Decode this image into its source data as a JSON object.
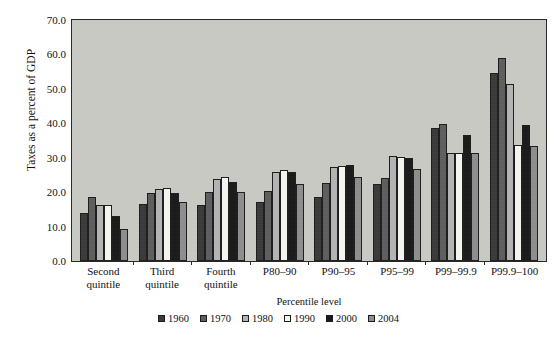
{
  "chart_data": {
    "type": "bar",
    "title": "",
    "xlabel": "Percentile level",
    "ylabel": "Taxes as a percent of GDP",
    "ylim": [
      0.0,
      70.0
    ],
    "yticks": [
      "0.0",
      "10.0",
      "20.0",
      "30.0",
      "40.0",
      "50.0",
      "60.0",
      "70.0"
    ],
    "ytick_values": [
      0,
      10,
      20,
      30,
      40,
      50,
      60,
      70
    ],
    "grid": false,
    "legend_position": "bottom",
    "categories": [
      "Second quintile",
      "Third quintile",
      "Fourth quintile",
      "P80–90",
      "P90–95",
      "P95–99",
      "P99–99.9",
      "P99.9–100"
    ],
    "category_lines": [
      [
        "Second",
        "quintile"
      ],
      [
        "Third",
        "quintile"
      ],
      [
        "Fourth",
        "quintile"
      ],
      [
        "P80–90",
        ""
      ],
      [
        "P90–95",
        ""
      ],
      [
        "P95–99",
        ""
      ],
      [
        "P99–99.9",
        ""
      ],
      [
        "P99.9–100",
        ""
      ]
    ],
    "series": [
      {
        "name": "1960",
        "color": "#3a3a3a",
        "values": [
          13.9,
          16.6,
          16.4,
          17.1,
          18.6,
          22.5,
          38.5,
          54.6
        ]
      },
      {
        "name": "1970",
        "color": "#5e5e5e",
        "values": [
          18.5,
          19.9,
          20.1,
          20.3,
          22.6,
          24.1,
          39.9,
          59.0
        ]
      },
      {
        "name": "1980",
        "color": "#b4b4b4",
        "values": [
          16.2,
          21.0,
          23.9,
          25.9,
          27.2,
          30.6,
          31.4,
          51.3
        ]
      },
      {
        "name": "1990",
        "color": "#f5f5f0",
        "values": [
          16.3,
          21.2,
          24.3,
          26.4,
          27.6,
          30.1,
          31.5,
          33.7
        ]
      },
      {
        "name": "2000",
        "color": "#1a1a1a",
        "values": [
          13.1,
          19.9,
          23.0,
          25.9,
          28.0,
          29.9,
          36.5,
          39.6
        ]
      },
      {
        "name": "2004",
        "color": "#8e8e8e",
        "values": [
          9.4,
          17.0,
          20.1,
          22.5,
          24.4,
          26.6,
          31.4,
          33.3
        ]
      }
    ]
  },
  "legend": {
    "items": [
      {
        "label": "1960",
        "color": "#3a3a3a"
      },
      {
        "label": "1970",
        "color": "#5e5e5e"
      },
      {
        "label": "1980",
        "color": "#b4b4b4"
      },
      {
        "label": "1990",
        "color": "#f5f5f0"
      },
      {
        "label": "2000",
        "color": "#1a1a1a"
      },
      {
        "label": "2004",
        "color": "#8e8e8e"
      }
    ]
  },
  "colors": {
    "plot_background": "#c9c9c4",
    "axis": "#2a2a2a",
    "page_background": "#ffffff"
  }
}
